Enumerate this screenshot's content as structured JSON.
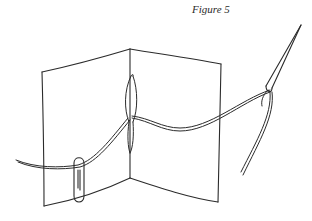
{
  "figure": {
    "caption": "Figure 5",
    "colors": {
      "background": "#ffffff",
      "ink": "#2b2b2b"
    },
    "elements": [
      {
        "name": "folded-paper-signature",
        "description": "Two-panel folded sheet, open"
      },
      {
        "name": "thread",
        "description": "Thread passing through the fold"
      },
      {
        "name": "paper-clip",
        "description": "Paper clip holding thread end on left panel"
      },
      {
        "name": "needle",
        "description": "Threaded needle at upper right"
      }
    ]
  }
}
